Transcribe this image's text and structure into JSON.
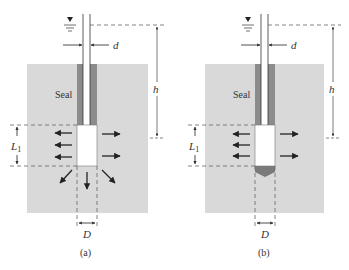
{
  "figure": {
    "colors": {
      "soil": "#d9d9d9",
      "seal": "#8c8c8c",
      "cavity": "#ffffff",
      "line": "#333333",
      "dashed": "#666666",
      "plug": "#7a7a7a"
    },
    "panels": [
      {
        "id": "a",
        "caption": "(a)",
        "seal_label": "Seal",
        "pipe_diameter_label": "d",
        "head_label": "h",
        "length_label": "L",
        "length_subscript": "1",
        "cavity_diameter_label": "D",
        "water_level_symbol": "▼",
        "flow_directions": [
          "left",
          "right",
          "down",
          "down-left",
          "down-right"
        ],
        "bottom_plugged": false
      },
      {
        "id": "b",
        "caption": "(b)",
        "seal_label": "Seal",
        "pipe_diameter_label": "d",
        "head_label": "h",
        "length_label": "L",
        "length_subscript": "1",
        "cavity_diameter_label": "D",
        "water_level_symbol": "▼",
        "flow_directions": [
          "left",
          "right"
        ],
        "bottom_plugged": true
      }
    ]
  }
}
